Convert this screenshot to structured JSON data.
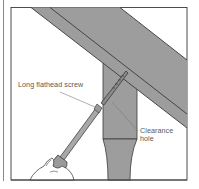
{
  "figure": {
    "colors": {
      "wood_fill": "#9d9d9d",
      "outline": "#3a3a3a",
      "background": "#ffffff",
      "label_text": "#5a5a5a",
      "leader_line": "#7a7a7a"
    },
    "labels": {
      "screw": "Long flathead screw",
      "hole_line1": "Clearance",
      "hole_line2": "hole"
    }
  }
}
